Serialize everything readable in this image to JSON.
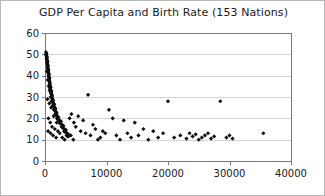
{
  "chart_data": {
    "type": "scatter",
    "title": "GDP Per Capita and Birth Rate (153 Nations)",
    "xlabel": "",
    "ylabel": "",
    "xlim": [
      0,
      40000
    ],
    "ylim": [
      0,
      60
    ],
    "xticks": [
      0,
      10000,
      20000,
      30000,
      40000
    ],
    "yticks": [
      0,
      10,
      20,
      30,
      40,
      50,
      60
    ],
    "xtick_labels": [
      "0",
      "10000",
      "20000",
      "30000",
      "40000"
    ],
    "ytick_labels": [
      "0",
      "10",
      "20",
      "30",
      "40",
      "50",
      "60"
    ],
    "grid": "horizontal",
    "legend": "none",
    "marker": "diamond",
    "marker_color": "#0d0d0d",
    "n_points": 153,
    "series": [
      {
        "name": "Nations",
        "points": [
          [
            150,
            51
          ],
          [
            180,
            50
          ],
          [
            210,
            49.5
          ],
          [
            240,
            50.5
          ],
          [
            260,
            48
          ],
          [
            280,
            49
          ],
          [
            300,
            47.5
          ],
          [
            320,
            48.5
          ],
          [
            340,
            46
          ],
          [
            360,
            47
          ],
          [
            380,
            45.5
          ],
          [
            400,
            46.5
          ],
          [
            420,
            44
          ],
          [
            440,
            45
          ],
          [
            460,
            43.5
          ],
          [
            480,
            44.5
          ],
          [
            500,
            42
          ],
          [
            520,
            43
          ],
          [
            540,
            41.5
          ],
          [
            560,
            42.5
          ],
          [
            580,
            40
          ],
          [
            600,
            41
          ],
          [
            620,
            39.5
          ],
          [
            640,
            40.5
          ],
          [
            660,
            38
          ],
          [
            680,
            39
          ],
          [
            700,
            37.5
          ],
          [
            720,
            38.5
          ],
          [
            740,
            36
          ],
          [
            760,
            37
          ],
          [
            780,
            35.5
          ],
          [
            800,
            36.5
          ],
          [
            830,
            34
          ],
          [
            860,
            35
          ],
          [
            890,
            33.5
          ],
          [
            920,
            34.5
          ],
          [
            950,
            32
          ],
          [
            980,
            33
          ],
          [
            1010,
            31.5
          ],
          [
            1040,
            32.5
          ],
          [
            1070,
            30
          ],
          [
            1100,
            31
          ],
          [
            1130,
            29.5
          ],
          [
            1160,
            30.5
          ],
          [
            1200,
            28
          ],
          [
            1240,
            29
          ],
          [
            1280,
            27.5
          ],
          [
            1320,
            28.5
          ],
          [
            1360,
            26
          ],
          [
            1400,
            27
          ],
          [
            1450,
            25.5
          ],
          [
            1500,
            26.5
          ],
          [
            1550,
            24
          ],
          [
            1600,
            25
          ],
          [
            1650,
            23.5
          ],
          [
            1700,
            24.5
          ],
          [
            1750,
            22
          ],
          [
            1800,
            23
          ],
          [
            1850,
            21.5
          ],
          [
            1900,
            22.5
          ],
          [
            1950,
            20
          ],
          [
            2000,
            21
          ],
          [
            2100,
            19.5
          ],
          [
            2200,
            20.5
          ],
          [
            2300,
            18
          ],
          [
            2400,
            19
          ],
          [
            2500,
            17.5
          ],
          [
            2600,
            18.5
          ],
          [
            2700,
            16
          ],
          [
            2800,
            17
          ],
          [
            2900,
            15.5
          ],
          [
            3000,
            16.5
          ],
          [
            3100,
            14
          ],
          [
            3200,
            15
          ],
          [
            3300,
            13.5
          ],
          [
            3400,
            14.5
          ],
          [
            3500,
            12
          ],
          [
            3600,
            13
          ],
          [
            3700,
            11.5
          ],
          [
            3800,
            12.5
          ],
          [
            300,
            42
          ],
          [
            450,
            38
          ],
          [
            600,
            35
          ],
          [
            750,
            33
          ],
          [
            900,
            30
          ],
          [
            1050,
            28
          ],
          [
            1250,
            26
          ],
          [
            1450,
            24
          ],
          [
            1700,
            22
          ],
          [
            2000,
            20
          ],
          [
            400,
            29
          ],
          [
            700,
            27
          ],
          [
            1000,
            25
          ],
          [
            1400,
            21
          ],
          [
            1900,
            18
          ],
          [
            550,
            20
          ],
          [
            850,
            18
          ],
          [
            1150,
            16
          ],
          [
            1600,
            15
          ],
          [
            2100,
            14
          ],
          [
            500,
            14
          ],
          [
            900,
            13
          ],
          [
            1300,
            12
          ],
          [
            1800,
            11
          ],
          [
            2400,
            13
          ],
          [
            2800,
            11
          ],
          [
            3200,
            10
          ],
          [
            3800,
            11.5
          ],
          [
            4200,
            12
          ],
          [
            4600,
            10
          ],
          [
            4000,
            20
          ],
          [
            4300,
            22
          ],
          [
            4700,
            18
          ],
          [
            5000,
            16
          ],
          [
            5400,
            21
          ],
          [
            5800,
            14
          ],
          [
            6200,
            19
          ],
          [
            6600,
            13
          ],
          [
            7000,
            31
          ],
          [
            7400,
            12
          ],
          [
            7800,
            17
          ],
          [
            8200,
            15
          ],
          [
            8600,
            10
          ],
          [
            9000,
            11
          ],
          [
            9400,
            14
          ],
          [
            9800,
            13
          ],
          [
            10400,
            24
          ],
          [
            11000,
            20
          ],
          [
            11600,
            12
          ],
          [
            12200,
            10
          ],
          [
            12800,
            19
          ],
          [
            13400,
            13
          ],
          [
            14000,
            11
          ],
          [
            14600,
            18
          ],
          [
            15200,
            12
          ],
          [
            16000,
            15
          ],
          [
            16800,
            10
          ],
          [
            17600,
            14
          ],
          [
            18400,
            11
          ],
          [
            19200,
            13
          ],
          [
            20000,
            28
          ],
          [
            21000,
            11
          ],
          [
            22000,
            12
          ],
          [
            23000,
            10.5
          ],
          [
            23500,
            13
          ],
          [
            24000,
            11.5
          ],
          [
            24500,
            12.5
          ],
          [
            25000,
            10
          ],
          [
            25500,
            11
          ],
          [
            26000,
            12
          ],
          [
            26500,
            13
          ],
          [
            27000,
            10.5
          ],
          [
            27500,
            11.5
          ],
          [
            28500,
            28
          ],
          [
            29500,
            11
          ],
          [
            30000,
            12
          ],
          [
            30500,
            10.5
          ],
          [
            35500,
            13
          ]
        ]
      }
    ]
  },
  "layout": {
    "plot_left": 44,
    "plot_right": 290,
    "plot_top": 32,
    "plot_bottom": 160
  }
}
